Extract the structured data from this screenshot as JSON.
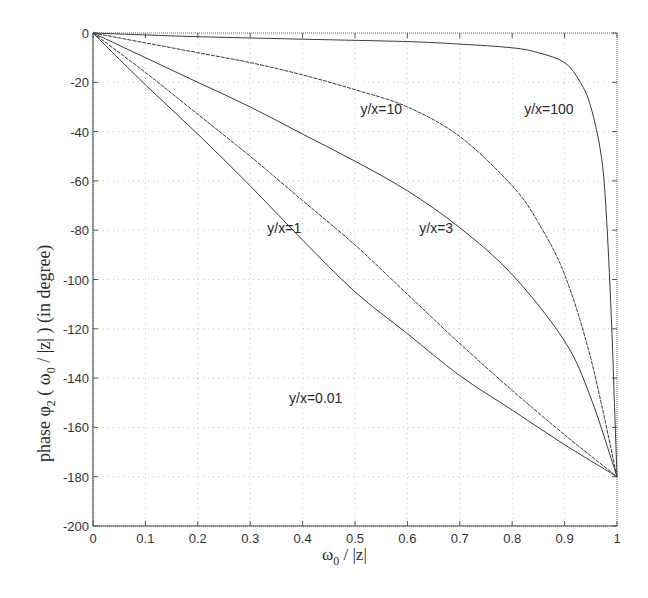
{
  "chart_data": {
    "type": "line",
    "title": "",
    "xlabel": "ω0 / |z|",
    "ylabel": "phase φ2 ( ω0 / |z| ) (in degree)",
    "xlim": [
      0,
      1
    ],
    "ylim": [
      -200,
      0
    ],
    "x_ticks": [
      0,
      0.1,
      0.2,
      0.3,
      0.4,
      0.5,
      0.6,
      0.7,
      0.8,
      0.9,
      1
    ],
    "x_tick_labels": [
      "0",
      "0.1",
      "0.2",
      "0.3",
      "0.4",
      "0.5",
      "0.6",
      "0.7",
      "0.8",
      "0.9",
      "1"
    ],
    "y_ticks": [
      0,
      -20,
      -40,
      -60,
      -80,
      -100,
      -120,
      -140,
      -160,
      -180,
      -200
    ],
    "y_tick_labels": [
      "0",
      "-20",
      "-40",
      "-60",
      "-80",
      "-100",
      "-120",
      "-140",
      "-160",
      "-180",
      "-200"
    ],
    "grid": true,
    "legend": "none (inline annotations)",
    "series": [
      {
        "name": "y/x=100",
        "label_pos": [
          0.87,
          -33
        ],
        "x": [
          0,
          0.2,
          0.4,
          0.6,
          0.7,
          0.8,
          0.85,
          0.9,
          0.93,
          0.95,
          0.97,
          0.98,
          0.99,
          0.995,
          1
        ],
        "y": [
          0,
          -1.5,
          -2.5,
          -3.5,
          -4.5,
          -6,
          -8,
          -12,
          -20,
          -30,
          -50,
          -75,
          -120,
          -150,
          -180
        ]
      },
      {
        "name": "y/x=10",
        "label_pos": [
          0.55,
          -33
        ],
        "x": [
          0,
          0.1,
          0.2,
          0.3,
          0.4,
          0.5,
          0.6,
          0.7,
          0.8,
          0.85,
          0.9,
          0.95,
          1
        ],
        "y": [
          0,
          -4,
          -8,
          -12,
          -17,
          -23,
          -30,
          -42,
          -62,
          -77,
          -98,
          -132,
          -180
        ]
      },
      {
        "name": "y/x=3",
        "label_pos": [
          0.655,
          -81
        ],
        "x": [
          0,
          0.1,
          0.2,
          0.3,
          0.4,
          0.5,
          0.6,
          0.7,
          0.8,
          0.9,
          0.95,
          1
        ],
        "y": [
          0,
          -10,
          -20,
          -30,
          -41,
          -52,
          -64,
          -79,
          -98,
          -125,
          -148,
          -180
        ]
      },
      {
        "name": "y/x=1",
        "label_pos": [
          0.365,
          -81
        ],
        "x": [
          0,
          0.1,
          0.2,
          0.3,
          0.4,
          0.5,
          0.6,
          0.7,
          0.8,
          0.9,
          1
        ],
        "y": [
          0,
          -16,
          -33,
          -50,
          -68,
          -86,
          -106,
          -126,
          -145,
          -163,
          -180
        ]
      },
      {
        "name": "y/x=0.01",
        "label_pos": [
          0.425,
          -150
        ],
        "x": [
          0,
          0.1,
          0.2,
          0.3,
          0.4,
          0.5,
          0.6,
          0.7,
          0.8,
          0.9,
          1
        ],
        "y": [
          0,
          -21,
          -41,
          -62,
          -84,
          -105,
          -122,
          -139,
          -153,
          -167,
          -180
        ]
      }
    ]
  },
  "axes": {
    "xlabel_main": "ω",
    "xlabel_sub": "0",
    "xlabel_rest": " / |z|",
    "ylabel_prefix": "phase φ",
    "ylabel_sub1": "2",
    "ylabel_mid": " ( ω",
    "ylabel_sub2": "0",
    "ylabel_rest": " / |z| )  (in degree)"
  },
  "style": {
    "line_color": "#3a3a3a",
    "grid_color": "#c8c8c8",
    "axis_color": "#555555"
  }
}
